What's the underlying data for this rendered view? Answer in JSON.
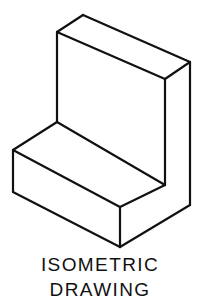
{
  "figure": {
    "name": "isometric-drawing-of-l-shaped-block",
    "background_color": "#ffffff",
    "line_color": "#111111",
    "fill_color": "#ffffff",
    "line_width": 2.2,
    "caption": {
      "line1": "ISOMETRIC",
      "line2": "DRAWING"
    },
    "faces": [
      {
        "id": "upright-top-face",
        "label": "upright-slab-top-face",
        "points": "57,32 83,15 190,62 165,79"
      },
      {
        "id": "upright-left-face",
        "label": "upright-slab-left-end-face",
        "points": "57,32 165,79 165,99 57,122"
      },
      {
        "id": "upright-right-face",
        "label": "upright-slab-right-side-face",
        "points": "165,79 190,62 190,205 165,185"
      },
      {
        "id": "base-top-face",
        "label": "base-step-top-face",
        "points": "13,150 57,122 165,185 120,207"
      },
      {
        "id": "base-left-face",
        "label": "base-step-left-end-face",
        "points": "13,150 120,207 120,247 13,192"
      },
      {
        "id": "base-front-face",
        "label": "base-step-front-face",
        "points": "120,207 165,185 190,205 120,247"
      }
    ],
    "edges": [
      {
        "id": "edge-top-back-left",
        "label": "upright-top-back-left-edge",
        "x1": 57,
        "y1": 32,
        "x2": 83,
        "y2": 15
      },
      {
        "id": "edge-top-back-right",
        "label": "upright-top-back-right-edge",
        "x1": 83,
        "y1": 15,
        "x2": 190,
        "y2": 62
      },
      {
        "id": "edge-top-front-right",
        "label": "upright-top-front-right-edge",
        "x1": 190,
        "y1": 62,
        "x2": 165,
        "y2": 79
      },
      {
        "id": "edge-top-front-left",
        "label": "upright-top-front-left-edge",
        "x1": 165,
        "y1": 79,
        "x2": 57,
        "y2": 32
      },
      {
        "id": "edge-upright-left-vertical",
        "label": "upright-left-vertical-edge",
        "x1": 57,
        "y1": 32,
        "x2": 57,
        "y2": 122
      },
      {
        "id": "edge-upright-mid-vertical",
        "label": "upright-inner-corner-vertical-edge",
        "x1": 165,
        "y1": 79,
        "x2": 165,
        "y2": 185
      },
      {
        "id": "edge-upright-right-vertical",
        "label": "upright-right-vertical-edge",
        "x1": 190,
        "y1": 62,
        "x2": 190,
        "y2": 205
      },
      {
        "id": "edge-step-riser-top",
        "label": "step-riser-top-edge",
        "x1": 57,
        "y1": 122,
        "x2": 165,
        "y2": 185
      },
      {
        "id": "edge-base-top-left",
        "label": "base-top-back-left-edge",
        "x1": 13,
        "y1": 150,
        "x2": 57,
        "y2": 122
      },
      {
        "id": "edge-base-top-front",
        "label": "base-top-front-edge",
        "x1": 13,
        "y1": 150,
        "x2": 120,
        "y2": 207
      },
      {
        "id": "edge-base-front-right",
        "label": "base-top-front-right-edge",
        "x1": 120,
        "y1": 207,
        "x2": 165,
        "y2": 185
      },
      {
        "id": "edge-base-left-vertical",
        "label": "base-left-vertical-edge",
        "x1": 13,
        "y1": 150,
        "x2": 13,
        "y2": 192
      },
      {
        "id": "edge-base-front-vertical",
        "label": "base-front-corner-vertical-edge",
        "x1": 120,
        "y1": 207,
        "x2": 120,
        "y2": 247
      },
      {
        "id": "edge-base-bottom-left",
        "label": "base-bottom-left-edge",
        "x1": 13,
        "y1": 192,
        "x2": 120,
        "y2": 247
      },
      {
        "id": "edge-base-bottom-right",
        "label": "base-bottom-right-edge",
        "x1": 120,
        "y1": 247,
        "x2": 190,
        "y2": 205
      }
    ]
  }
}
